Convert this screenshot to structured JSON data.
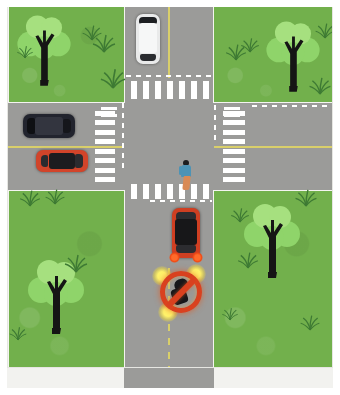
{
  "scene": {
    "title": "Four-way intersection road scene",
    "width": 340,
    "height": 395,
    "colors": {
      "grass": "#72b04c",
      "asphalt": "#9b9b99",
      "lane_marking_white": "#ffffff",
      "center_line_yellow": "#d9cf6a",
      "sign_red": "#d9411f",
      "sign_glow_yellow": "#fff36a",
      "frame_white": "#ffffff"
    }
  },
  "roads": {
    "vertical": {
      "name": "vertical-road",
      "lane_count": 2,
      "center_line": "yellow",
      "center_line_style_bottom": "dashed",
      "center_line_style_top": "solid"
    },
    "horizontal": {
      "name": "horizontal-road",
      "lane_count": 2,
      "center_line": "yellow",
      "center_line_style": "solid"
    }
  },
  "crosswalks": [
    {
      "id": "zebra-top",
      "orientation": "vertical-bars",
      "stripes": 7,
      "position": "north-leg"
    },
    {
      "id": "zebra-bottom",
      "orientation": "vertical-bars",
      "stripes": 7,
      "position": "south-leg"
    },
    {
      "id": "zebra-left",
      "orientation": "horizontal-bars",
      "stripes": 8,
      "position": "west-leg"
    },
    {
      "id": "zebra-right",
      "orientation": "horizontal-bars",
      "stripes": 8,
      "position": "east-leg"
    }
  ],
  "grass_quadrants": [
    {
      "id": "grass-tl",
      "label": "northwest-lot",
      "tree": true
    },
    {
      "id": "grass-tr",
      "label": "northeast-lot",
      "tree": true
    },
    {
      "id": "grass-bl",
      "label": "southwest-lot",
      "tree": true
    },
    {
      "id": "grass-br",
      "label": "southeast-lot",
      "tree": true
    }
  ],
  "vehicles": [
    {
      "id": "car-white",
      "color_name": "white",
      "color": "#e9eaea",
      "heading": "south",
      "road": "vertical-road",
      "lane": "left"
    },
    {
      "id": "car-dark",
      "color_name": "dark navy",
      "color": "#22242e",
      "heading": "west",
      "road": "horizontal-road",
      "lane": "upper"
    },
    {
      "id": "car-red-left",
      "color_name": "red",
      "color": "#d2442a",
      "heading": "east",
      "road": "horizontal-road",
      "lane": "lower"
    },
    {
      "id": "car-red-main",
      "color_name": "red",
      "color": "#cf3f22",
      "heading": "north",
      "road": "vertical-road",
      "lane": "right",
      "brake_lights": "on"
    }
  ],
  "pedestrian": {
    "id": "pedestrian",
    "shirt_color": "#4d93b5",
    "pants_color": "#d98a55",
    "location": "south-crosswalk",
    "heading": "east"
  },
  "sign": {
    "id": "no-entry-sign",
    "type": "prohibition",
    "shape": "circle-with-diagonal-slash",
    "ring_color": "#d9411f",
    "pictogram": "vehicle",
    "glow": "yellow",
    "meaning": "no vehicles / do not proceed"
  }
}
